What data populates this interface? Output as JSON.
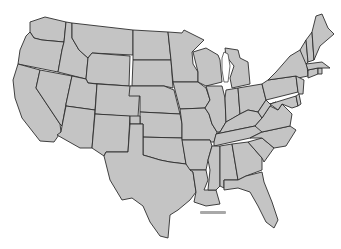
{
  "map": {
    "type": "choropleth-outline",
    "region": "Contiguous United States",
    "fill_color": "#c4c4c4",
    "border_color": "#2e2e2e",
    "background_color": "#ffffff",
    "scale_bar_color": "#a8a8a8",
    "states": [
      {
        "id": "WA",
        "points": "30,22 45,17 66,22 64,42 42,40 34,38 30,32"
      },
      {
        "id": "OR",
        "points": "30,32 34,38 42,40 64,42 62,50 58,72 18,64 20,50 26,36"
      },
      {
        "id": "CA",
        "points": "18,64 40,70 36,88 60,124 61,132 54,142 40,141 22,118 15,98 13,80"
      },
      {
        "id": "ID",
        "points": "66,22 72,23 72,38 79,50 88,58 86,79 58,72 62,50 64,42"
      },
      {
        "id": "NV",
        "points": "40,70 72,76 66,104 62,126 60,124 36,88"
      },
      {
        "id": "MT",
        "points": "72,23 133,30 133,55 92,53 88,58 79,50 72,38"
      },
      {
        "id": "WY",
        "points": "92,53 130,56 129,86 88,83 86,79 88,58"
      },
      {
        "id": "UT",
        "points": "72,76 86,79 88,83 97,84 95,110 66,106 66,104"
      },
      {
        "id": "AZ",
        "points": "66,106 95,110 92,148 80,148 57,135 61,132 62,126"
      },
      {
        "id": "CO",
        "points": "97,84 129,86 140,87 138,117 95,114"
      },
      {
        "id": "NM",
        "points": "95,114 130,116 128,152 106,152 104,156 92,148"
      },
      {
        "id": "ND",
        "points": "133,30 168,32 171,60 133,60"
      },
      {
        "id": "SD",
        "points": "133,60 171,60 173,88 164,86 132,86"
      },
      {
        "id": "NE",
        "points": "130,86 164,86 174,90 180,114 140,112 140,96 129,96"
      },
      {
        "id": "KS",
        "points": "140,112 180,114 182,124 182,138 140,137"
      },
      {
        "id": "OK",
        "points": "130,116 140,116 140,137 182,138 186,164 170,162 160,160 150,157 143,155 143,124 130,124"
      },
      {
        "id": "TX",
        "points": "130,124 143,124 143,155 150,157 160,160 170,162 186,164 193,172 196,192 190,200 178,210 170,215 168,238 160,236 150,222 143,206 132,198 122,200 110,180 104,156 106,152 128,152"
      },
      {
        "id": "MN",
        "points": "168,32 182,33 184,30 204,40 192,52 193,64 198,72 198,82 173,82 171,60"
      },
      {
        "id": "IA",
        "points": "173,82 198,82 206,88 210,100 205,108 180,109 175,90"
      },
      {
        "id": "MO",
        "points": "180,109 205,108 209,114 212,124 217,132 214,142 210,142 210,140 182,140 182,124"
      },
      {
        "id": "AR",
        "points": "182,140 210,140 212,146 208,160 206,170 190,170 186,164"
      },
      {
        "id": "LA",
        "points": "190,170 206,170 208,180 204,190 216,190 220,204 206,206 194,202 196,192 193,172"
      },
      {
        "id": "WI",
        "points": "193,52 206,48 218,55 220,60 222,82 206,86 198,82 198,72"
      },
      {
        "id": "IL",
        "points": "206,86 222,86 225,98 226,122 220,132 217,132 212,124 209,114 205,108 210,100"
      },
      {
        "id": "MI",
        "points": "225,48 238,50 240,58 248,62 250,84 232,88 230,78 234,66 226,56"
      },
      {
        "id": "IN",
        "points": "226,90 238,88 240,114 230,120 226,122 225,98"
      },
      {
        "id": "OH",
        "points": "238,88 250,86 262,84 266,100 258,112 248,110 240,114"
      },
      {
        "id": "KY",
        "points": "220,132 226,122 240,114 248,110 258,112 262,118 255,126 216,134"
      },
      {
        "id": "TN",
        "points": "214,142 216,134 255,126 268,124 262,132 250,138 214,146"
      },
      {
        "id": "MS",
        "points": "208,160 212,146 220,146 220,186 216,190 208,190 210,170"
      },
      {
        "id": "AL",
        "points": "220,146 232,144 238,180 224,180 224,188 220,186"
      },
      {
        "id": "GA",
        "points": "232,144 248,142 262,158 262,170 246,176 238,180"
      },
      {
        "id": "FL",
        "points": "224,180 238,180 246,176 262,172 264,182 272,202 278,220 274,228 266,222 258,206 250,192 238,188 224,190"
      },
      {
        "id": "SC",
        "points": "248,142 262,138 274,148 264,162 262,158"
      },
      {
        "id": "NC",
        "points": "250,138 262,132 290,126 296,130 286,146 274,148 262,138"
      },
      {
        "id": "VA",
        "points": "255,126 262,118 270,106 278,110 282,104 292,114 290,126 262,132"
      },
      {
        "id": "WV",
        "points": "258,112 266,100 270,104 276,102 270,106 262,118"
      },
      {
        "id": "PA",
        "points": "262,84 268,80 296,76 298,92 266,100"
      },
      {
        "id": "NY",
        "points": "268,80 276,72 290,56 300,50 306,54 308,76 298,78 296,76"
      },
      {
        "id": "MD",
        "points": "270,104 296,96 298,106 292,108 282,104 278,110"
      },
      {
        "id": "DE",
        "points": "296,96 299,94 301,104 298,106"
      },
      {
        "id": "NJ",
        "points": "296,76 304,80 303,94 299,94 298,92"
      },
      {
        "id": "CT",
        "points": "308,70 318,68 318,74 308,78"
      },
      {
        "id": "RI",
        "points": "318,68 322,68 322,74 318,74"
      },
      {
        "id": "MA",
        "points": "306,64 322,62 330,68 322,68 318,68 308,70"
      },
      {
        "id": "VT",
        "points": "300,50 306,40 308,62 306,64"
      },
      {
        "id": "NH",
        "points": "306,40 312,32 314,60 308,62"
      },
      {
        "id": "ME",
        "points": "312,32 316,16 322,14 328,28 334,34 320,46 314,60"
      }
    ],
    "lakes": [
      {
        "id": "Lake Michigan",
        "points": "224,52 228,54 230,66 228,82 224,82 222,70 222,58"
      }
    ],
    "scale_bar": {
      "x": 200,
      "y": 211,
      "width": 26,
      "height": 3
    }
  }
}
